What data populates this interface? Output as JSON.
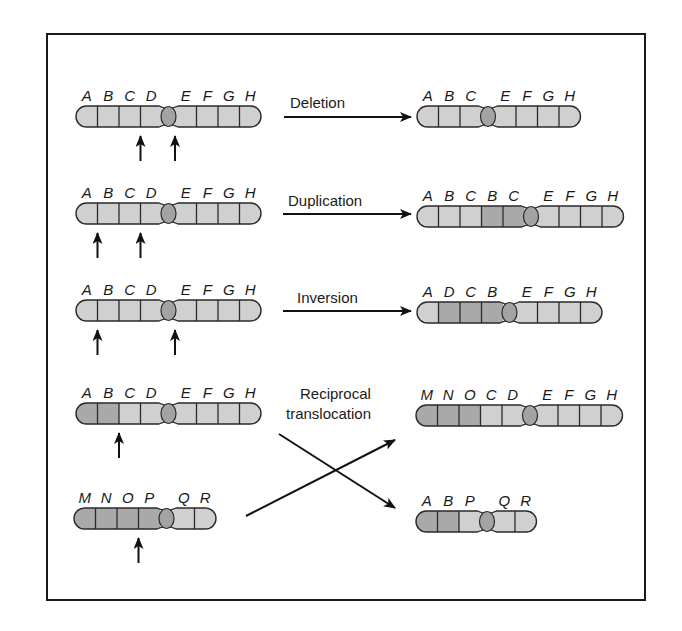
{
  "figure": {
    "colors": {
      "segment_light": "#d0d0d0",
      "segment_dark": "#a9a9a9",
      "centromere": "#a3a3a3",
      "outline": "#2a2a2a",
      "arrow": "#111111"
    }
  },
  "rows": [
    {
      "id": "deletion",
      "label_lines": [
        "Deletion"
      ],
      "original": {
        "genes": [
          "A",
          "B",
          "C",
          "D",
          "E",
          "F",
          "G",
          "H"
        ],
        "centromere_after_index": 4,
        "dark": [],
        "break_arrows_at_boundaries": [
          3,
          4
        ]
      },
      "result": {
        "genes": [
          "A",
          "B",
          "C",
          "E",
          "F",
          "G",
          "H"
        ],
        "centromere_after_index": 3,
        "dark": []
      }
    },
    {
      "id": "duplication",
      "label_lines": [
        "Duplication"
      ],
      "original": {
        "genes": [
          "A",
          "B",
          "C",
          "D",
          "E",
          "F",
          "G",
          "H"
        ],
        "centromere_after_index": 4,
        "dark": [],
        "break_arrows_at_boundaries": [
          1,
          3
        ]
      },
      "result": {
        "genes": [
          "A",
          "B",
          "C",
          "B",
          "C",
          "E",
          "F",
          "G",
          "H"
        ],
        "centromere_after_index": 5,
        "dark": [
          3,
          4
        ]
      }
    },
    {
      "id": "inversion",
      "label_lines": [
        "Inversion"
      ],
      "original": {
        "genes": [
          "A",
          "B",
          "C",
          "D",
          "E",
          "F",
          "G",
          "H"
        ],
        "centromere_after_index": 4,
        "dark": [],
        "break_arrows_at_boundaries": [
          1,
          4
        ]
      },
      "result": {
        "genes": [
          "A",
          "D",
          "C",
          "B",
          "E",
          "F",
          "G",
          "H"
        ],
        "centromere_after_index": 4,
        "dark": [
          1,
          2,
          3
        ]
      }
    },
    {
      "id": "reciprocal-translocation",
      "label_lines": [
        "Reciprocal",
        "translocation"
      ],
      "original": {
        "genes": [
          "A",
          "B",
          "C",
          "D",
          "E",
          "F",
          "G",
          "H"
        ],
        "centromere_after_index": 4,
        "dark": [
          0,
          1
        ],
        "break_arrows_at_boundaries": [
          2
        ]
      },
      "original_2": {
        "genes": [
          "M",
          "N",
          "O",
          "P",
          "Q",
          "R"
        ],
        "centromere_after_index": 4,
        "dark": [
          0,
          1,
          2,
          3
        ],
        "break_arrows_at_boundaries": [
          3
        ]
      },
      "result": {
        "genes": [
          "M",
          "N",
          "O",
          "C",
          "D",
          "E",
          "F",
          "G",
          "H"
        ],
        "centromere_after_index": 5,
        "dark": [
          0,
          1,
          2
        ]
      },
      "result_2": {
        "genes": [
          "A",
          "B",
          "P",
          "Q",
          "R"
        ],
        "centromere_after_index": 3,
        "dark": [
          0,
          1
        ]
      }
    }
  ]
}
